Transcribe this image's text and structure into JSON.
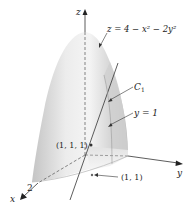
{
  "figure": {
    "axes": {
      "z_label": "z",
      "y_label": "y",
      "x_label": "x",
      "x_tick": "2"
    },
    "labels": {
      "surface_eq": "z = 4 − x² − 2y²",
      "curve_name": "C",
      "curve_sub": "1",
      "plane_eq": "y = 1",
      "point_3d": "(1, 1, 1)",
      "point_2d": "(1, 1)"
    },
    "colors": {
      "surface_light": "#f2f2f2",
      "surface_mid": "#d9d9d9",
      "surface_dark": "#bdbdbd",
      "lines": "#333333"
    }
  }
}
